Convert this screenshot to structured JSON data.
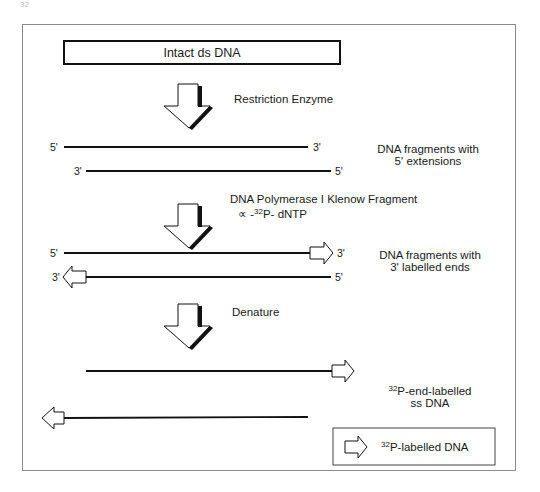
{
  "page_header": {
    "page_number": "32",
    "running_title": "..."
  },
  "diagram": {
    "start_box": "Intact ds DNA",
    "steps": [
      {
        "label": "Restriction Enzyme"
      },
      {
        "label": "DNA Polymerase I Klenow Fragment",
        "sub_prefix": "∝ -",
        "sub_sup": "32",
        "sub_suffix": "P- dNTP"
      },
      {
        "label": "Denature"
      }
    ],
    "stage1": {
      "top_strand": {
        "left": "5'",
        "right": "3'"
      },
      "bottom_strand": {
        "left": "3'",
        "right": "5'"
      },
      "desc_line1": "DNA fragments with",
      "desc_line2": "5' extensions"
    },
    "stage2": {
      "top_strand": {
        "left": "5'",
        "right": "3'"
      },
      "bottom_strand": {
        "left": "3'",
        "right": "5'"
      },
      "desc_line1": "DNA fragments with",
      "desc_line2": "3' labelled ends"
    },
    "stage3": {
      "desc_sup": "32",
      "desc_line1": "P-end-labelled",
      "desc_line2": "ss DNA"
    },
    "legend": {
      "sup": "32",
      "label": "P-labelled DNA",
      "icon": "hollow-arrow-icon"
    }
  }
}
